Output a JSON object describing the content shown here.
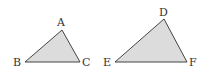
{
  "figure": {
    "fill_color": "#dcdcdc",
    "stroke_color": "#444444",
    "triangles": [
      {
        "name": "ABC",
        "vertices": {
          "A": {
            "label": "A",
            "x": 62,
            "y": 30
          },
          "B": {
            "label": "B",
            "x": 25,
            "y": 62
          },
          "C": {
            "label": "C",
            "x": 80,
            "y": 62
          }
        }
      },
      {
        "name": "DEF",
        "vertices": {
          "D": {
            "label": "D",
            "x": 164,
            "y": 19
          },
          "E": {
            "label": "E",
            "x": 115,
            "y": 62
          },
          "F": {
            "label": "F",
            "x": 187,
            "y": 62
          }
        }
      }
    ]
  }
}
